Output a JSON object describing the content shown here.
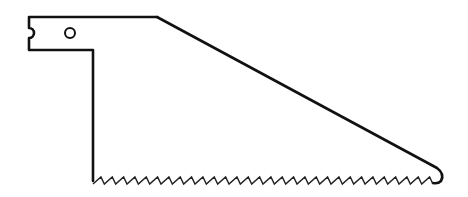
{
  "figure": {
    "caption": "",
    "stroke_color": "#111111",
    "background_color": "#ffffff",
    "teeth_count": 30,
    "parts": [
      "tang",
      "mounting-hole",
      "tang-notch",
      "blade-body",
      "cutting-teeth",
      "tip-hook"
    ]
  }
}
